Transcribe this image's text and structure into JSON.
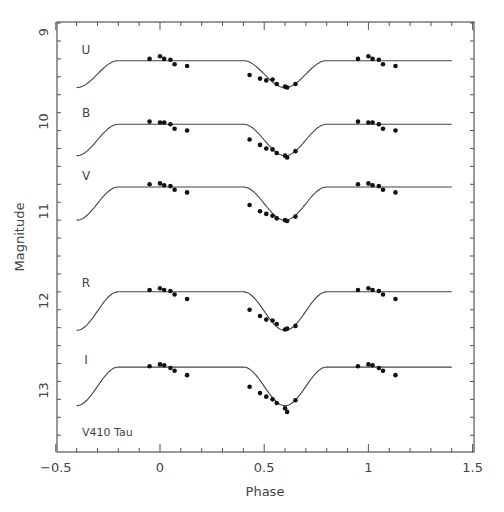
{
  "chart_data": {
    "type": "scatter",
    "title": "",
    "annotation": "V410 Tau",
    "xlabel": "Phase",
    "ylabel": "Magnitude",
    "xlim": [
      -0.5,
      1.5
    ],
    "ylim": [
      13.7,
      8.9
    ],
    "y_inverted": true,
    "x_ticks": [
      -0.5,
      0,
      0.5,
      1,
      1.5
    ],
    "x_tick_labels": [
      "−0.5",
      "0",
      "0.5",
      "1",
      "1.5"
    ],
    "y_ticks": [
      9,
      10,
      11,
      12,
      13
    ],
    "y_tick_labels": [
      "9",
      "10",
      "11",
      "12",
      "13"
    ],
    "grid": false,
    "legend": "none",
    "series": [
      {
        "name": "U",
        "flat": 9.32,
        "min": 9.62,
        "edge": 9.62,
        "points": [
          [
            -0.05,
            9.3
          ],
          [
            0.0,
            9.27
          ],
          [
            0.02,
            9.3
          ],
          [
            0.05,
            9.31
          ],
          [
            0.07,
            9.36
          ],
          [
            0.13,
            9.38
          ],
          [
            0.43,
            9.48
          ],
          [
            0.48,
            9.52
          ],
          [
            0.51,
            9.54
          ],
          [
            0.54,
            9.53
          ],
          [
            0.56,
            9.58
          ],
          [
            0.6,
            9.61
          ],
          [
            0.61,
            9.62
          ],
          [
            0.65,
            9.58
          ],
          [
            0.95,
            9.3
          ],
          [
            1.0,
            9.27
          ],
          [
            1.02,
            9.3
          ],
          [
            1.05,
            9.31
          ],
          [
            1.07,
            9.36
          ],
          [
            1.13,
            9.38
          ]
        ]
      },
      {
        "name": "B",
        "flat": 10.03,
        "min": 10.38,
        "edge": 10.37,
        "points": [
          [
            -0.05,
            10.0
          ],
          [
            0.0,
            10.01
          ],
          [
            0.02,
            10.01
          ],
          [
            0.05,
            10.03
          ],
          [
            0.07,
            10.08
          ],
          [
            0.13,
            10.1
          ],
          [
            0.43,
            10.2
          ],
          [
            0.48,
            10.26
          ],
          [
            0.51,
            10.3
          ],
          [
            0.54,
            10.31
          ],
          [
            0.56,
            10.35
          ],
          [
            0.6,
            10.38
          ],
          [
            0.61,
            10.4
          ],
          [
            0.65,
            10.33
          ],
          [
            0.95,
            10.0
          ],
          [
            1.0,
            10.01
          ],
          [
            1.02,
            10.01
          ],
          [
            1.05,
            10.03
          ],
          [
            1.07,
            10.08
          ],
          [
            1.13,
            10.1
          ]
        ]
      },
      {
        "name": "V",
        "flat": 10.73,
        "min": 11.1,
        "edge": 11.1,
        "points": [
          [
            -0.05,
            10.7
          ],
          [
            0.0,
            10.69
          ],
          [
            0.02,
            10.71
          ],
          [
            0.05,
            10.72
          ],
          [
            0.07,
            10.76
          ],
          [
            0.13,
            10.79
          ],
          [
            0.43,
            10.93
          ],
          [
            0.48,
            11.0
          ],
          [
            0.51,
            11.03
          ],
          [
            0.54,
            11.05
          ],
          [
            0.56,
            11.08
          ],
          [
            0.6,
            11.1
          ],
          [
            0.61,
            11.11
          ],
          [
            0.65,
            11.06
          ],
          [
            0.95,
            10.7
          ],
          [
            1.0,
            10.69
          ],
          [
            1.02,
            10.71
          ],
          [
            1.05,
            10.72
          ],
          [
            1.07,
            10.76
          ],
          [
            1.13,
            10.79
          ]
        ]
      },
      {
        "name": "R",
        "flat": 11.9,
        "min": 12.33,
        "edge": 12.32,
        "points": [
          [
            -0.05,
            11.88
          ],
          [
            0.0,
            11.86
          ],
          [
            0.02,
            11.88
          ],
          [
            0.05,
            11.89
          ],
          [
            0.07,
            11.93
          ],
          [
            0.13,
            11.98
          ],
          [
            0.43,
            12.1
          ],
          [
            0.48,
            12.17
          ],
          [
            0.51,
            12.21
          ],
          [
            0.54,
            12.22
          ],
          [
            0.56,
            12.26
          ],
          [
            0.6,
            12.32
          ],
          [
            0.61,
            12.31
          ],
          [
            0.65,
            12.28
          ],
          [
            0.95,
            11.88
          ],
          [
            1.0,
            11.86
          ],
          [
            1.02,
            11.88
          ],
          [
            1.05,
            11.89
          ],
          [
            1.07,
            11.93
          ],
          [
            1.13,
            11.98
          ]
        ]
      },
      {
        "name": "I",
        "flat": 12.74,
        "min": 13.17,
        "edge": 13.17,
        "points": [
          [
            -0.05,
            12.73
          ],
          [
            0.0,
            12.71
          ],
          [
            0.02,
            12.72
          ],
          [
            0.05,
            12.75
          ],
          [
            0.07,
            12.78
          ],
          [
            0.13,
            12.83
          ],
          [
            0.43,
            12.96
          ],
          [
            0.48,
            13.03
          ],
          [
            0.51,
            13.07
          ],
          [
            0.54,
            13.1
          ],
          [
            0.56,
            13.14
          ],
          [
            0.6,
            13.2
          ],
          [
            0.61,
            13.24
          ],
          [
            0.65,
            13.11
          ],
          [
            0.95,
            12.73
          ],
          [
            1.0,
            12.71
          ],
          [
            1.02,
            12.72
          ],
          [
            1.05,
            12.75
          ],
          [
            1.07,
            12.78
          ],
          [
            1.13,
            12.83
          ]
        ]
      }
    ],
    "band_labels": [
      {
        "text": "U",
        "mag": 9.25
      },
      {
        "text": "B",
        "mag": 9.95
      },
      {
        "text": "V",
        "mag": 10.65
      },
      {
        "text": "R",
        "mag": 11.85
      },
      {
        "text": "I",
        "mag": 12.7
      }
    ]
  }
}
